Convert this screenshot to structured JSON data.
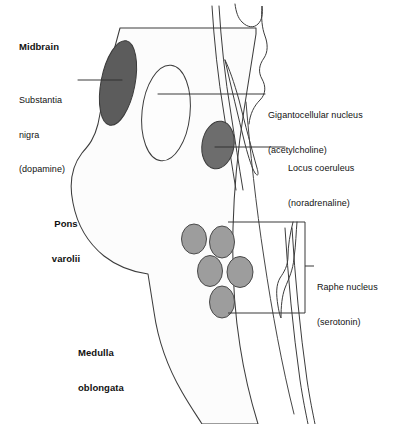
{
  "figure": {
    "type": "anatomical-diagram",
    "background_color": "#ffffff",
    "outline_color": "#3c3c3c",
    "brainstem_fill": "#fcfcfc"
  },
  "region_labels": {
    "midbrain": "Midbrain",
    "pons_line1": "Pons",
    "pons_line2": "varolii",
    "medulla_line1": "Medulla",
    "medulla_line2": "oblongata"
  },
  "nuclei": [
    {
      "id": "substantia-nigra",
      "name_line1": "Substantia",
      "name_line2": "nigra",
      "name_line3": "(dopamine)",
      "transmitter": "dopamine",
      "fill": "#5c5c5c",
      "side": "left"
    },
    {
      "id": "gigantocellular-nucleus",
      "name_line1": "Gigantocellular nucleus",
      "name_line2": "(acetylcholine)",
      "transmitter": "acetylcholine",
      "fill": "#fdfdfd",
      "side": "right"
    },
    {
      "id": "locus-coeruleus",
      "name_line1": "Locus coeruleus",
      "name_line2": "(noradrenaline)",
      "transmitter": "noradrenaline",
      "fill": "#6d6d6d",
      "side": "right"
    },
    {
      "id": "raphe-nucleus",
      "name_line1": "Raphe nucleus",
      "name_line2": "(serotonin)",
      "transmitter": "serotonin",
      "fill": "#9d9d9d",
      "side": "right",
      "count": 5
    }
  ]
}
